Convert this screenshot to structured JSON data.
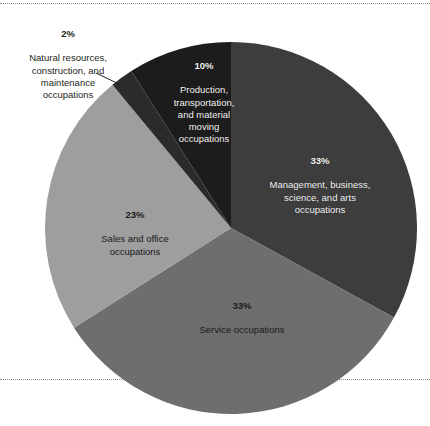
{
  "chart_data": {
    "type": "pie",
    "title": "",
    "subtitle": "",
    "xlabel": "",
    "ylabel": "",
    "legend_position": "inside-slices",
    "grid": false,
    "start_angle_deg": 0,
    "direction": "clockwise",
    "units": "percent",
    "categories": [
      "Management, business, science, and arts occupations",
      "Service occupations",
      "Sales and office occupations",
      "Natural resources, construction, and maintenance occupations",
      "Production, transportation, and material moving occupations"
    ],
    "values": [
      33,
      33,
      23,
      2,
      10
    ],
    "slices": [
      {
        "id": "management",
        "percent_label": "33%",
        "value": 33,
        "name": "Management, business,\nscience, and arts\noccupations",
        "name_plain": "Management, business, science, and arts occupations",
        "color": "#3d3d3d",
        "label_color": "#f2f2f2",
        "label_placement": "inside",
        "start_deg": 0,
        "end_deg": 118.8
      },
      {
        "id": "service",
        "percent_label": "33%",
        "value": 33,
        "name": "Service occupations",
        "name_plain": "Service occupations",
        "color": "#6e6e6e",
        "label_color": "#1a1a1a",
        "label_placement": "inside",
        "start_deg": 118.8,
        "end_deg": 237.6
      },
      {
        "id": "sales",
        "percent_label": "23%",
        "value": 23,
        "name": "Sales and office\noccupations",
        "name_plain": "Sales and office occupations",
        "color": "#9e9e9e",
        "label_color": "#1a1a1a",
        "label_placement": "inside",
        "start_deg": 237.6,
        "end_deg": 320.4
      },
      {
        "id": "natural-resources",
        "percent_label": "2%",
        "value": 2,
        "name": "Natural resources,\nconstruction, and\nmaintenance\noccupations",
        "name_plain": "Natural resources, construction, and maintenance occupations",
        "color": "#2b2b2b",
        "label_color": "#231f20",
        "label_placement": "outside-callout",
        "start_deg": 320.4,
        "end_deg": 327.6
      },
      {
        "id": "production",
        "percent_label": "10%",
        "value": 10,
        "name": "Production,\ntransportation,\nand material\nmoving\noccupations",
        "name_plain": "Production, transportation, and material moving occupations",
        "color": "#1c1c1c",
        "label_color": "#f2f2f2",
        "label_placement": "inside",
        "start_deg": 327.6,
        "end_deg": 360
      }
    ],
    "colors": {
      "management": "#3d3d3d",
      "service": "#6e6e6e",
      "sales": "#9e9e9e",
      "natural_resources": "#2b2b2b",
      "production": "#1c1c1c",
      "background": "#ffffff",
      "rule": "#8c8c8c",
      "leader_line": "#231f20"
    }
  }
}
